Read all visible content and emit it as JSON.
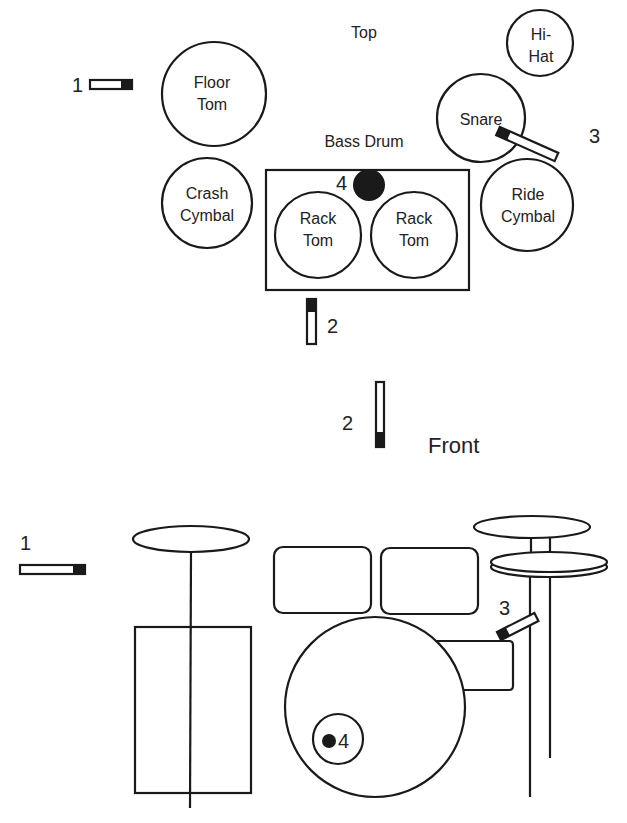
{
  "top_view": {
    "title": "Top",
    "bass_drum_label": "Bass Drum",
    "drums": {
      "floor_tom": [
        "Floor",
        "Tom"
      ],
      "crash": [
        "Crash",
        "Cymbal"
      ],
      "rack_tom_left": [
        "Rack",
        "Tom"
      ],
      "rack_tom_right": [
        "Rack",
        "Tom"
      ],
      "hi_hat": [
        "Hi-",
        "Hat"
      ],
      "snare": [
        "Snare"
      ],
      "ride": [
        "Ride",
        "Cymbal"
      ]
    },
    "mics": {
      "mic1": "1",
      "mic2": "2",
      "mic3": "3",
      "mic4": "4"
    }
  },
  "front_view": {
    "title": "Front",
    "mics": {
      "mic1": "1",
      "mic2": "2",
      "mic3": "3",
      "mic4": "4"
    }
  },
  "colors": {
    "line": "#1a1a1a",
    "mic_capsule": "#1a1a1a",
    "background": "#ffffff"
  }
}
